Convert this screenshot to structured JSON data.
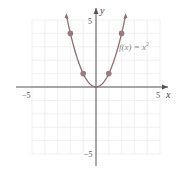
{
  "chart_data": {
    "type": "line",
    "title": "",
    "xlabel": "x",
    "ylabel": "y",
    "xlim": [
      -5,
      5
    ],
    "ylim": [
      -5,
      5
    ],
    "grid": true,
    "x_tick_labels": [
      "-5",
      "5"
    ],
    "y_tick_labels": [
      "5",
      "-5"
    ],
    "annotation": "f(x) = x²",
    "series": [
      {
        "name": "f(x) = x^2",
        "function": "x^2",
        "domain": [
          -2.3,
          2.3
        ],
        "color": "#8a6f73",
        "marked_points": [
          {
            "x": -2,
            "y": 4
          },
          {
            "x": -1,
            "y": 1
          },
          {
            "x": 0,
            "y": 0
          },
          {
            "x": 1,
            "y": 1
          },
          {
            "x": 2,
            "y": 4
          }
        ]
      }
    ]
  },
  "labels": {
    "x_axis": "x",
    "y_axis": "y",
    "x_min": "−5",
    "x_max": "5",
    "y_max": "5",
    "y_min": "−5",
    "function_label_prefix": "f(x) = x",
    "function_label_exp": "2"
  },
  "colors": {
    "curve": "#8a6f73",
    "point": "#9a7a7e",
    "grid": "#ececec",
    "axis": "#555555"
  }
}
